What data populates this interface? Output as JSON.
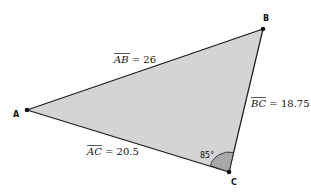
{
  "diagram": {
    "type": "triangle",
    "fill_color": "#d4d4d4",
    "angle_fill_color": "#a8a8a8",
    "stroke_color": "#1a1a1a",
    "vertices": [
      {
        "name": "A",
        "label": "A"
      },
      {
        "name": "B",
        "label": "B"
      },
      {
        "name": "C",
        "label": "C"
      }
    ],
    "sides": [
      {
        "segment": "AB",
        "overline": "AB",
        "equals": " = 26",
        "length": 26
      },
      {
        "segment": "BC",
        "overline": "BC",
        "equals": " = 18.75",
        "length": 18.75
      },
      {
        "segment": "AC",
        "overline": "AC",
        "equals": " = 20.5",
        "length": 20.5
      }
    ],
    "angles": [
      {
        "vertex": "C",
        "label": "85°",
        "degrees": 85
      }
    ]
  }
}
